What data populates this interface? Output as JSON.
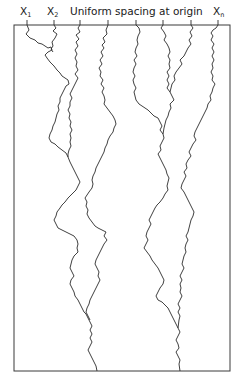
{
  "diagram": {
    "caption": "Uniform spacing at origin",
    "labels": [
      {
        "base": "X",
        "sub": "1"
      },
      {
        "base": "X",
        "sub": "2"
      },
      {
        "base": "X",
        "sub": "n"
      }
    ],
    "frame": {
      "x": 14,
      "y": 25,
      "width": 216,
      "height": 346
    },
    "paths_start_x": [
      27,
      54,
      80,
      108,
      136,
      163,
      191,
      218
    ],
    "paths_count": 8,
    "end_paths_count": 2,
    "line_color": "#2a2a2a"
  }
}
